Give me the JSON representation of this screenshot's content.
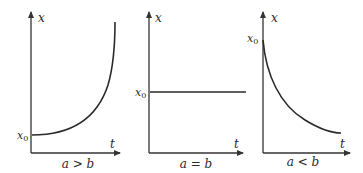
{
  "panels": [
    {
      "id": "growth",
      "y_axis_label": "x",
      "x_axis_label": "t",
      "initial_label": "x",
      "initial_subscript": "0",
      "condition": "a > b",
      "curve": "exponential increase from x0"
    },
    {
      "id": "constant",
      "y_axis_label": "x",
      "x_axis_label": "t",
      "initial_label": "x",
      "initial_subscript": "0",
      "condition": "a = b",
      "curve": "horizontal line at x0"
    },
    {
      "id": "decay",
      "y_axis_label": "x",
      "x_axis_label": "t",
      "initial_label": "x",
      "initial_subscript": "0",
      "condition": "a < b",
      "curve": "exponential decrease from x0"
    }
  ],
  "colors": {
    "line": "#2a2a2a",
    "background": "#ffffff"
  }
}
